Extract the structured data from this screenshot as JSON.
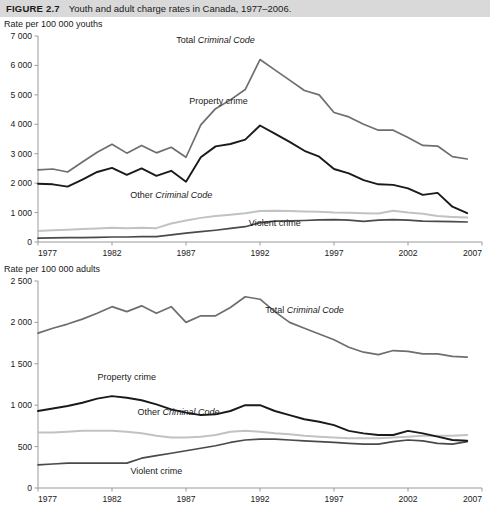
{
  "figure": {
    "number": "FIGURE 2.7",
    "title": "Youth and adult charge rates in Canada, 1977–2006."
  },
  "colors": {
    "total": "#6e6e6e",
    "property": "#1a1a1a",
    "other": "#c2c2c2",
    "violent": "#4a4a4a",
    "axis": "#9a9a9a",
    "caption_bar": "#d9d9d9"
  },
  "panels": {
    "youth": {
      "axis_title": "Rate per 100 000 youths",
      "labels": {
        "total_pre": "Total ",
        "total_ital": "Criminal Code",
        "property": "Property crime",
        "other_pre": "Other ",
        "other_ital": "Criminal Code",
        "violent": "Violent crime"
      },
      "y_ticks": [
        "7 000",
        "6 000",
        "5 000",
        "4 000",
        "3 000",
        "2 000",
        "1 000",
        "0"
      ],
      "x_ticks": [
        "1977",
        "1982",
        "1987",
        "1992",
        "1997",
        "2002",
        "2007"
      ]
    },
    "adult": {
      "axis_title": "Rate per 100 000 adults",
      "labels": {
        "total_pre": "Total ",
        "total_ital": "Criminal Code",
        "property": "Property crime",
        "other_pre": "Other ",
        "other_ital": "Criminal Code",
        "violent": "Violent crime"
      },
      "y_ticks": [
        "2 500",
        "2 000",
        "1 500",
        "1 000",
        "500",
        "0"
      ],
      "x_ticks": [
        "1977",
        "1982",
        "1987",
        "1992",
        "1997",
        "2002",
        "2007"
      ]
    }
  },
  "chart_data": [
    {
      "type": "line",
      "id": "youth-charge-rates",
      "title": "Rate per 100 000 youths",
      "xlabel": "",
      "ylabel": "Rate per 100 000 youths",
      "xlim": [
        1977,
        2007
      ],
      "ylim": [
        0,
        7000
      ],
      "ytick_step": 1000,
      "xtick_step": 5,
      "grid": false,
      "legend": "inline-annotations",
      "x": [
        1977,
        1978,
        1979,
        1980,
        1981,
        1982,
        1983,
        1984,
        1985,
        1986,
        1987,
        1988,
        1989,
        1990,
        1991,
        1992,
        1993,
        1994,
        1995,
        1996,
        1997,
        1998,
        1999,
        2000,
        2001,
        2002,
        2003,
        2004,
        2005,
        2006
      ],
      "series": [
        {
          "name": "Total Criminal Code",
          "color": "#6e6e6e",
          "values": [
            2450,
            2480,
            2380,
            2720,
            3050,
            3320,
            3020,
            3280,
            3030,
            3220,
            2880,
            3980,
            4530,
            4830,
            5180,
            6200,
            5850,
            5500,
            5150,
            5000,
            4400,
            4250,
            4000,
            3800,
            3800,
            3550,
            3280,
            3260,
            2900,
            2820
          ]
        },
        {
          "name": "Property crime",
          "color": "#1a1a1a",
          "values": [
            1980,
            1960,
            1880,
            2120,
            2380,
            2520,
            2280,
            2500,
            2250,
            2420,
            2050,
            2880,
            3250,
            3330,
            3480,
            3960,
            3680,
            3400,
            3100,
            2900,
            2480,
            2330,
            2100,
            1960,
            1940,
            1820,
            1600,
            1670,
            1200,
            980
          ]
        },
        {
          "name": "Other Criminal Code",
          "color": "#c2c2c2",
          "values": [
            370,
            400,
            420,
            440,
            460,
            480,
            470,
            480,
            470,
            630,
            730,
            820,
            880,
            930,
            980,
            1050,
            1060,
            1050,
            1040,
            1030,
            1000,
            990,
            980,
            970,
            1060,
            1000,
            960,
            880,
            850,
            830
          ]
        },
        {
          "name": "Violent crime",
          "color": "#4a4a4a",
          "values": [
            130,
            140,
            150,
            150,
            160,
            170,
            170,
            180,
            180,
            240,
            300,
            350,
            400,
            460,
            520,
            660,
            710,
            720,
            730,
            750,
            760,
            740,
            700,
            740,
            760,
            740,
            710,
            700,
            690,
            680
          ]
        }
      ]
    },
    {
      "type": "line",
      "id": "adult-charge-rates",
      "title": "Rate per 100 000 adults",
      "xlabel": "",
      "ylabel": "Rate per 100 000 adults",
      "xlim": [
        1977,
        2007
      ],
      "ylim": [
        0,
        2500
      ],
      "ytick_step": 500,
      "xtick_step": 5,
      "grid": false,
      "legend": "inline-annotations",
      "x": [
        1977,
        1978,
        1979,
        1980,
        1981,
        1982,
        1983,
        1984,
        1985,
        1986,
        1987,
        1988,
        1989,
        1990,
        1991,
        1992,
        1993,
        1994,
        1995,
        1996,
        1997,
        1998,
        1999,
        2000,
        2001,
        2002,
        2003,
        2004,
        2005,
        2006
      ],
      "series": [
        {
          "name": "Total Criminal Code",
          "color": "#6e6e6e",
          "values": [
            1870,
            1930,
            1980,
            2040,
            2110,
            2190,
            2130,
            2200,
            2110,
            2190,
            2000,
            2080,
            2080,
            2180,
            2310,
            2280,
            2130,
            2000,
            1930,
            1860,
            1790,
            1700,
            1640,
            1610,
            1660,
            1650,
            1620,
            1620,
            1590,
            1580
          ]
        },
        {
          "name": "Property crime",
          "color": "#1a1a1a",
          "values": [
            930,
            960,
            990,
            1030,
            1080,
            1110,
            1090,
            1060,
            1010,
            950,
            910,
            880,
            890,
            930,
            1000,
            1000,
            930,
            880,
            830,
            800,
            760,
            690,
            660,
            640,
            640,
            690,
            660,
            620,
            580,
            570
          ]
        },
        {
          "name": "Other Criminal Code",
          "color": "#c2c2c2",
          "values": [
            670,
            670,
            680,
            690,
            690,
            690,
            680,
            660,
            630,
            610,
            610,
            620,
            640,
            680,
            690,
            680,
            660,
            650,
            630,
            620,
            610,
            600,
            600,
            600,
            610,
            620,
            630,
            630,
            630,
            640
          ]
        },
        {
          "name": "Violent crime",
          "color": "#4a4a4a",
          "values": [
            280,
            290,
            300,
            300,
            300,
            300,
            300,
            360,
            390,
            420,
            450,
            480,
            510,
            550,
            580,
            590,
            590,
            580,
            570,
            560,
            550,
            540,
            530,
            530,
            560,
            580,
            570,
            540,
            530,
            560
          ]
        }
      ]
    }
  ]
}
